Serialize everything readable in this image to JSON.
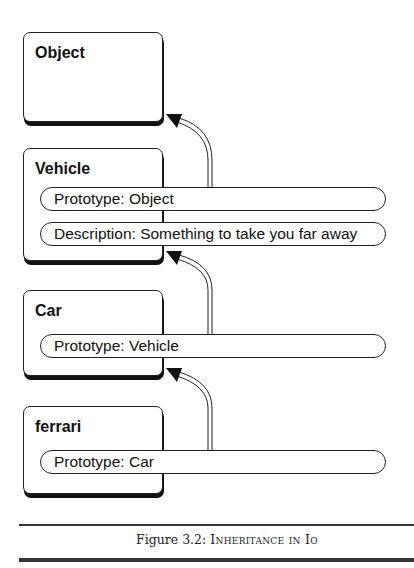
{
  "diagram": {
    "nodes": [
      {
        "id": "object",
        "title": "Object",
        "slots": []
      },
      {
        "id": "vehicle",
        "title": "Vehicle",
        "slots": [
          "Prototype: Object",
          "Description: Something to take you far away"
        ]
      },
      {
        "id": "car",
        "title": "Car",
        "slots": [
          "Prototype: Vehicle"
        ]
      },
      {
        "id": "ferrari",
        "title": "ferrari",
        "slots": [
          "Prototype: Car"
        ]
      }
    ],
    "edges": [
      {
        "from": "vehicle.Prototype",
        "to": "object"
      },
      {
        "from": "car.Prototype",
        "to": "vehicle"
      },
      {
        "from": "ferrari.Prototype",
        "to": "car"
      }
    ]
  },
  "caption": {
    "label": "Figure 3.2:",
    "title": "Inheritance in Io"
  }
}
